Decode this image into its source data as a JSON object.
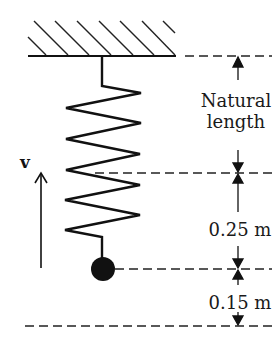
{
  "diagram": {
    "type": "spring-mass",
    "labels": {
      "velocity": "v",
      "natural_line1": "Natural",
      "natural_line2": "length",
      "extension": "0.25 m",
      "further": "0.15 m"
    },
    "colors": {
      "ink": "#111111",
      "background": "#ffffff"
    }
  }
}
